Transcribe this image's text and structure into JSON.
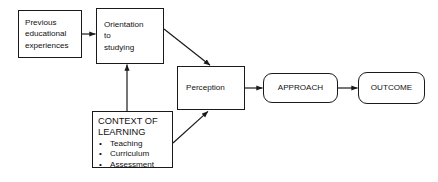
{
  "diagram": {
    "background_color": "#ffffff",
    "line_color": "#1a1a1a",
    "text_color": "#111111",
    "nodes": {
      "previous": {
        "shape": "rectangle",
        "lines": [
          "Previous",
          "educational",
          "experiences"
        ]
      },
      "orientation": {
        "shape": "rectangle",
        "lines": [
          "Orientation",
          "to",
          "studying"
        ]
      },
      "perception": {
        "shape": "rectangle",
        "label": "Perception"
      },
      "approach": {
        "shape": "rounded-rectangle",
        "label": "APPROACH"
      },
      "outcome": {
        "shape": "rounded-rectangle",
        "label": "OUTCOME"
      },
      "context": {
        "shape": "rectangle",
        "heading_lines": [
          "CONTEXT OF",
          "LEARNING"
        ],
        "bullet_marker": "•",
        "bullets": [
          "Teaching",
          "Curriculum",
          "Assessment"
        ]
      }
    },
    "edges": [
      {
        "from": "previous",
        "to": "orientation",
        "style": "arrow-right",
        "shape": "horizontal"
      },
      {
        "from": "orientation",
        "to": "perception",
        "style": "arrow-right",
        "shape": "diagonal-down"
      },
      {
        "from": "context",
        "to": "orientation",
        "style": "arrow-up",
        "shape": "vertical"
      },
      {
        "from": "context",
        "to": "perception",
        "style": "arrow-up-right",
        "shape": "diagonal-up"
      },
      {
        "from": "perception",
        "to": "approach",
        "style": "arrow-right",
        "shape": "horizontal"
      },
      {
        "from": "approach",
        "to": "outcome",
        "style": "arrow-right",
        "shape": "horizontal"
      }
    ]
  }
}
